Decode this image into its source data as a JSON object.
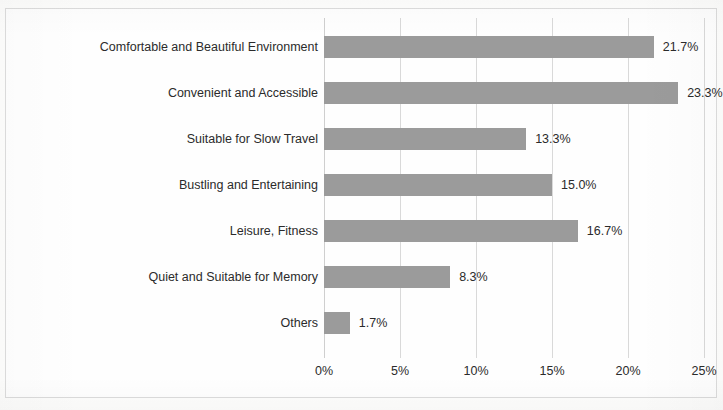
{
  "chart_data": {
    "type": "bar",
    "orientation": "horizontal",
    "title": "",
    "subtitle": "",
    "xlabel": "",
    "ylabel": "",
    "xlim": [
      0,
      25
    ],
    "xtick_labels": [
      "0%",
      "5%",
      "10%",
      "15%",
      "20%",
      "25%"
    ],
    "xticks": [
      0,
      5,
      10,
      15,
      20,
      25
    ],
    "grid": true,
    "legend": false,
    "legend_position": "none",
    "bar_color": "#9b9b9b",
    "gridline_color": "#d9d9d9",
    "text_color": "#2b2b2b",
    "background_color": "#fdfdfc",
    "value_label_suffix": "%",
    "categories": [
      "Comfortable and Beautiful Environment",
      "Convenient and Accessible",
      "Suitable for Slow Travel",
      "Bustling and Entertaining",
      "Leisure, Fitness",
      "Quiet and Suitable for Memory",
      "Others"
    ],
    "values": [
      21.7,
      23.3,
      13.3,
      15.0,
      16.7,
      8.3,
      1.7
    ],
    "value_labels": [
      "21.7%",
      "23.3%",
      "13.3%",
      "15.0%",
      "16.7%",
      "8.3%",
      "1.7%"
    ]
  }
}
